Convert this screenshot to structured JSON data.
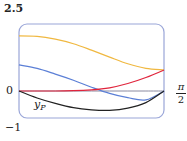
{
  "chart_data": {
    "type": "line",
    "title": "",
    "xlabel": "",
    "ylabel": "",
    "xlim": [
      0,
      1.5708
    ],
    "ylim": [
      -1,
      2.5
    ],
    "x_tick_labels": [
      "0",
      "π/2"
    ],
    "y_tick_labels": [
      "2.5",
      "0",
      "-1"
    ],
    "grid": false,
    "legend": null,
    "annotations": [
      {
        "text": "y_P",
        "near_series": "black",
        "x": 0.3,
        "y": -0.35
      }
    ],
    "x": [
      0,
      0.1963,
      0.3927,
      0.589,
      0.7854,
      0.9817,
      1.1781,
      1.3744,
      1.5708
    ],
    "series": [
      {
        "name": "yellow",
        "color": "#f0b840",
        "values": [
          2.05,
          2.03,
          1.93,
          1.76,
          1.52,
          1.26,
          1.01,
          0.84,
          0.78
        ]
      },
      {
        "name": "blue",
        "color": "#5b7fd6",
        "values": [
          0.97,
          0.84,
          0.63,
          0.4,
          0.14,
          -0.09,
          -0.25,
          -0.33,
          0.0
        ]
      },
      {
        "name": "red",
        "color": "#e0243c",
        "values": [
          0.0,
          0.0,
          0.0,
          0.01,
          0.04,
          0.12,
          0.28,
          0.5,
          0.78
        ]
      },
      {
        "name": "black (y_P)",
        "color": "#222222",
        "values": [
          0.0,
          -0.26,
          -0.46,
          -0.62,
          -0.7,
          -0.72,
          -0.64,
          -0.43,
          0.0
        ]
      },
      {
        "name": "zero-axis",
        "color": "#8a8aa0",
        "values": [
          0,
          0,
          0,
          0,
          0,
          0,
          0,
          0,
          0
        ]
      }
    ]
  },
  "axes": {
    "y_top": "2.5",
    "y_zero": "0",
    "y_bottom": "−1",
    "x_end_num": "π",
    "x_end_den": "2"
  },
  "curve_label": {
    "base": "y",
    "sub": "P"
  }
}
